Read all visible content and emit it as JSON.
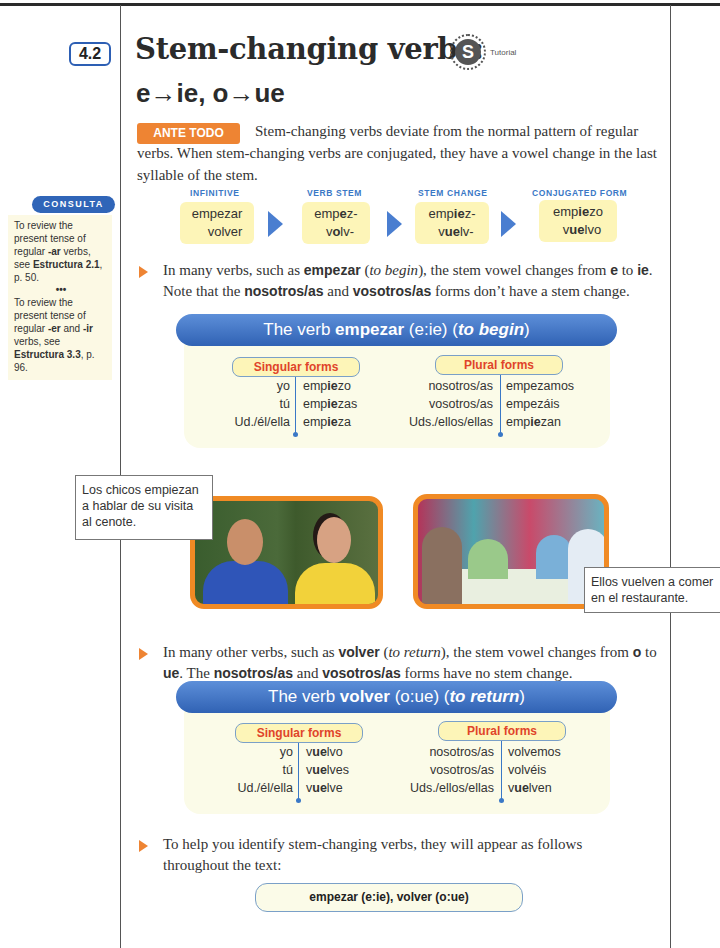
{
  "section": {
    "number": "4.2",
    "title": "Stem-changing verbs:",
    "subtitle": "e→ie, o→ue",
    "tutorial_label": "Tutorial",
    "tutorial_icon": "S"
  },
  "intro": {
    "badge": "ANTE TODO",
    "text": "Stem-changing verbs deviate from the normal pattern of regular verbs. When stem-changing verbs are conjugated, they have a vowel change in the last syllable of the stem."
  },
  "consulta": {
    "title": "CONSULTA",
    "notes": [
      {
        "pre": "To review the present tense of regular ",
        "b1": "-ar",
        "mid": " verbs, see ",
        "b2": "Estructura 2.1",
        "post": ", p. 50."
      },
      {
        "pre": "To review the present tense of regular ",
        "b1": "-er",
        "mid1": " and ",
        "b3": "-ir",
        "mid": " verbs, see ",
        "b2": "Estructura 3.3",
        "post": ", p. 96."
      }
    ],
    "separator": "•••"
  },
  "flow": {
    "headers": [
      "INFINITIVE",
      "VERB STEM",
      "STEM CHANGE",
      "CONJUGATED FORM"
    ],
    "rows": {
      "infinitive": [
        "empezar",
        "volver"
      ],
      "stem": [
        [
          "emp",
          "e",
          "z-"
        ],
        [
          "v",
          "o",
          "lv-"
        ]
      ],
      "change": [
        [
          "emp",
          "ie",
          "z-"
        ],
        [
          "v",
          "ue",
          "lv-"
        ]
      ],
      "conjugated": [
        [
          "emp",
          "ie",
          "zo"
        ],
        [
          "v",
          "ue",
          "lvo"
        ]
      ]
    }
  },
  "paragraph1": {
    "a": "In many verbs, such as ",
    "b1": "empezar",
    "c": " (",
    "i1": "to begin",
    "d": "), the stem vowel changes from ",
    "b2": "e",
    "e": " to ",
    "b3": "ie",
    "f": ". Note that the ",
    "b4": "nosotros/as",
    "g": " and ",
    "b5": "vosotros/as",
    "h": " forms don’t have a stem change."
  },
  "table_empezar": {
    "banner_pre": "The verb ",
    "banner_verb": "empezar",
    "banner_mid": " (e:ie) (",
    "banner_gloss": "to begin",
    "banner_post": ")",
    "singular_label": "Singular forms",
    "plural_label": "Plural forms",
    "singular": [
      {
        "pron": "yo",
        "pre": "emp",
        "b": "ie",
        "post": "zo"
      },
      {
        "pron": "tú",
        "pre": "emp",
        "b": "ie",
        "post": "zas"
      },
      {
        "pron": "Ud./él/ella",
        "pre": "emp",
        "b": "ie",
        "post": "za"
      }
    ],
    "plural": [
      {
        "pron": "nosotros/as",
        "pre": "empezamos",
        "b": "",
        "post": ""
      },
      {
        "pron": "vosotros/as",
        "pre": "empezáis",
        "b": "",
        "post": ""
      },
      {
        "pron": "Uds./ellos/ellas",
        "pre": "emp",
        "b": "ie",
        "post": "zan"
      }
    ]
  },
  "photos": {
    "left_caption": "Los chicos empiezan a hablar de su visita al cenote.",
    "right_caption": "Ellos vuelven a comer en el restaurante."
  },
  "paragraph2": {
    "a": "In many other verbs, such as ",
    "b1": "volver",
    "c": " (",
    "i1": "to return",
    "d": "), the stem vowel changes from ",
    "b2": "o",
    "e": " to ",
    "b3": "ue",
    "f": ". The ",
    "b4": "nosotros/as",
    "g": " and ",
    "b5": "vosotros/as",
    "h": " forms have no stem change."
  },
  "table_volver": {
    "banner_pre": "The verb ",
    "banner_verb": "volver",
    "banner_mid": " (o:ue) (",
    "banner_gloss": "to return",
    "banner_post": ")",
    "singular_label": "Singular forms",
    "plural_label": "Plural forms",
    "singular": [
      {
        "pron": "yo",
        "pre": "v",
        "b": "ue",
        "post": "lvo"
      },
      {
        "pron": "tú",
        "pre": "v",
        "b": "ue",
        "post": "lves"
      },
      {
        "pron": "Ud./él/ella",
        "pre": "v",
        "b": "ue",
        "post": "lve"
      }
    ],
    "plural": [
      {
        "pron": "nosotros/as",
        "pre": "volvemos",
        "b": "",
        "post": ""
      },
      {
        "pron": "vosotros/as",
        "pre": "volvéis",
        "b": "",
        "post": ""
      },
      {
        "pron": "Uds./ellos/ellas",
        "pre": "v",
        "b": "ue",
        "post": "lven"
      }
    ]
  },
  "paragraph3": {
    "text": "To help you identify stem-changing verbs, they will appear as follows throughout the text:"
  },
  "example": {
    "text": "empezar (e:ie), volver (o:ue)"
  },
  "colors": {
    "accent_orange": "#ee8433",
    "banner_blue": "#3062b4",
    "header_blue": "#3a78c6",
    "box_yellow": "#fdf5b8",
    "forms_red": "#e0442a"
  }
}
